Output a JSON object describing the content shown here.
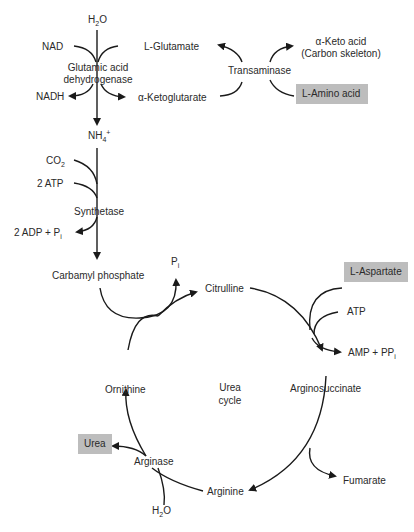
{
  "diagram": {
    "nodes": {
      "h2o_top": "H2O",
      "nad": "NAD",
      "nadh": "NADH",
      "gdh_1": "Glutamic acid",
      "gdh_2": "dehydrogenase",
      "l_glutamate": "L-Glutamate",
      "a_ketoglutarate": "α-Ketoglutarate",
      "transaminase": "Transaminase",
      "keto_acid_1": "α-Keto acid",
      "keto_acid_2": "(Carbon skeleton)",
      "l_amino_acid": "L-Amino acid",
      "nh4": "NH4+",
      "co2": "CO2",
      "atp2": "2 ATP",
      "synthetase": "Synthetase",
      "adp_pi": "2 ADP + Pi",
      "carbamyl_phosphate": "Carbamyl phosphate",
      "pi": "Pi",
      "citrulline": "Citrulline",
      "l_aspartate": "L-Aspartate",
      "atp": "ATP",
      "amp_ppi": "AMP + PPi",
      "argininosuccinate": "Arginosuccinate",
      "fumarate": "Fumarate",
      "arginine": "Arginine",
      "arginase": "Arginase",
      "h2o_bottom": "H2O",
      "urea": "Urea",
      "ornithine": "Ornithine",
      "cycle_1": "Urea",
      "cycle_2": "cycle"
    },
    "highlight_color": "#bdbdbd",
    "line_color": "#1a1a1a"
  }
}
